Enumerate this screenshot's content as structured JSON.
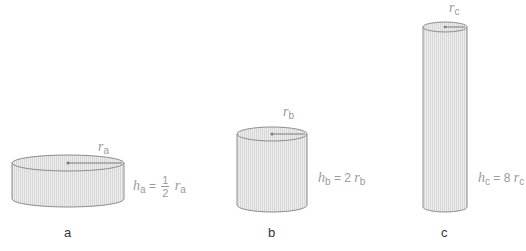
{
  "colors": {
    "stroke": "#8c8c8c",
    "fill": "#e9e9e9",
    "hatch": "#d4d4d4",
    "label": "#9a9a9a",
    "caption": "#333333"
  },
  "cylinders": [
    {
      "id": "a",
      "caption": "a",
      "radius_symbol": "r",
      "radius_sub": "a",
      "height_symbol": "h",
      "height_sub": "a",
      "eq": "=",
      "frac_num": "1",
      "frac_den": "2",
      "rhs_symbol": "r",
      "rhs_sub": "a"
    },
    {
      "id": "b",
      "caption": "b",
      "radius_symbol": "r",
      "radius_sub": "b",
      "height_symbol": "h",
      "height_sub": "b",
      "relation": "= 2",
      "rhs_symbol": "r",
      "rhs_sub": "b"
    },
    {
      "id": "c",
      "caption": "c",
      "radius_symbol": "r",
      "radius_sub": "c",
      "height_symbol": "h",
      "height_sub": "c",
      "relation": "= 8",
      "rhs_symbol": "r",
      "rhs_sub": "c"
    }
  ]
}
